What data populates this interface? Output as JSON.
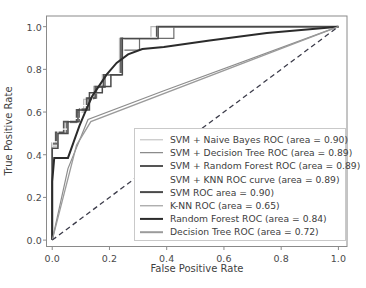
{
  "chart_data": {
    "type": "line",
    "title": "",
    "xlabel": "False Positive Rate",
    "ylabel": "True Positive Rate",
    "xlim": [
      -0.02,
      1.03
    ],
    "ylim": [
      -0.03,
      1.05
    ],
    "xticks": [
      "0.0",
      "0.2",
      "0.4",
      "0.6",
      "0.8",
      "1.0"
    ],
    "xtick_values": [
      0.0,
      0.2,
      0.4,
      0.6,
      0.8,
      1.0
    ],
    "yticks": [
      "0.0",
      "0.2",
      "0.4",
      "0.6",
      "0.8",
      "1.0"
    ],
    "ytick_values": [
      0.0,
      0.2,
      0.4,
      0.6,
      0.8,
      1.0
    ],
    "grid": false,
    "legend_position": "center-right",
    "series": [
      {
        "name": "SVM + Naive Bayes ROC (area = 0.90)",
        "area": 0.9,
        "color": "#b9b9b9",
        "width": 1.2,
        "dash": "none",
        "points": [
          [
            0.0,
            0.0
          ],
          [
            0.0,
            0.44
          ],
          [
            0.02,
            0.44
          ],
          [
            0.02,
            0.5
          ],
          [
            0.045,
            0.5
          ],
          [
            0.045,
            0.55
          ],
          [
            0.085,
            0.55
          ],
          [
            0.085,
            0.6
          ],
          [
            0.11,
            0.6
          ],
          [
            0.11,
            0.66
          ],
          [
            0.145,
            0.66
          ],
          [
            0.145,
            0.72
          ],
          [
            0.175,
            0.72
          ],
          [
            0.175,
            0.775
          ],
          [
            0.235,
            0.775
          ],
          [
            0.235,
            0.945
          ],
          [
            0.345,
            0.945
          ],
          [
            0.345,
            1.0
          ],
          [
            1.0,
            1.0
          ]
        ]
      },
      {
        "name": "SVM + Decision Tree ROC (area = 0.89)",
        "area": 0.89,
        "color": "#6e6e6e",
        "width": 1.2,
        "dash": "none",
        "points": [
          [
            0.0,
            0.0
          ],
          [
            0.0,
            0.45
          ],
          [
            0.015,
            0.45
          ],
          [
            0.015,
            0.5
          ],
          [
            0.05,
            0.5
          ],
          [
            0.05,
            0.555
          ],
          [
            0.095,
            0.555
          ],
          [
            0.095,
            0.615
          ],
          [
            0.125,
            0.615
          ],
          [
            0.125,
            0.665
          ],
          [
            0.155,
            0.665
          ],
          [
            0.155,
            0.715
          ],
          [
            0.185,
            0.715
          ],
          [
            0.185,
            0.775
          ],
          [
            0.245,
            0.775
          ],
          [
            0.245,
            0.89
          ],
          [
            0.305,
            0.89
          ],
          [
            0.305,
            0.945
          ],
          [
            0.425,
            0.945
          ],
          [
            0.425,
            1.0
          ],
          [
            1.0,
            1.0
          ]
        ]
      },
      {
        "name": "SVM + Random Forest ROC (area = 0.89)",
        "area": 0.89,
        "color": "#555555",
        "width": 1.6,
        "dash": "none",
        "points": [
          [
            0.0,
            0.0
          ],
          [
            0.0,
            0.455
          ],
          [
            0.012,
            0.455
          ],
          [
            0.012,
            0.505
          ],
          [
            0.04,
            0.505
          ],
          [
            0.04,
            0.555
          ],
          [
            0.085,
            0.555
          ],
          [
            0.085,
            0.61
          ],
          [
            0.12,
            0.61
          ],
          [
            0.12,
            0.665
          ],
          [
            0.15,
            0.665
          ],
          [
            0.15,
            0.72
          ],
          [
            0.18,
            0.72
          ],
          [
            0.18,
            0.775
          ],
          [
            0.24,
            0.775
          ],
          [
            0.24,
            0.945
          ],
          [
            0.365,
            0.945
          ],
          [
            0.365,
            1.0
          ],
          [
            1.0,
            1.0
          ]
        ]
      },
      {
        "name": "SVM + KNN ROC curve (area = 0.89)",
        "area": 0.89,
        "color": "#ffffff",
        "width": 1.2,
        "dash": "none",
        "points": [
          [
            0.0,
            0.0
          ],
          [
            0.0,
            0.46
          ],
          [
            0.02,
            0.46
          ],
          [
            0.02,
            0.52
          ],
          [
            0.06,
            0.52
          ],
          [
            0.06,
            0.57
          ],
          [
            0.1,
            0.57
          ],
          [
            0.1,
            0.63
          ],
          [
            0.14,
            0.63
          ],
          [
            0.14,
            0.69
          ],
          [
            0.19,
            0.69
          ],
          [
            0.19,
            0.78
          ],
          [
            0.25,
            0.78
          ],
          [
            0.25,
            0.95
          ],
          [
            0.37,
            0.95
          ],
          [
            0.37,
            1.0
          ],
          [
            1.0,
            1.0
          ]
        ]
      },
      {
        "name": "SVM ROC area = 0.90)",
        "area": 0.9,
        "color": "#4a4a4a",
        "width": 1.5,
        "dash": "none",
        "points": [
          [
            0.0,
            0.0
          ],
          [
            0.0,
            0.43
          ],
          [
            0.02,
            0.43
          ],
          [
            0.02,
            0.5
          ],
          [
            0.055,
            0.5
          ],
          [
            0.055,
            0.555
          ],
          [
            0.09,
            0.555
          ],
          [
            0.09,
            0.61
          ],
          [
            0.13,
            0.61
          ],
          [
            0.13,
            0.69
          ],
          [
            0.175,
            0.69
          ],
          [
            0.175,
            0.72
          ],
          [
            0.205,
            0.72
          ],
          [
            0.205,
            0.775
          ],
          [
            0.245,
            0.775
          ],
          [
            0.245,
            0.945
          ],
          [
            0.37,
            0.945
          ],
          [
            0.37,
            1.0
          ],
          [
            1.0,
            1.0
          ]
        ]
      },
      {
        "name": "K-NN ROC (area = 0.65)",
        "area": 0.65,
        "color": "#8d8d8d",
        "width": 1.2,
        "dash": "none",
        "points": [
          [
            0.0,
            0.0
          ],
          [
            0.055,
            0.335
          ],
          [
            0.125,
            0.565
          ],
          [
            0.39,
            0.7
          ],
          [
            1.0,
            1.0
          ]
        ]
      },
      {
        "name": "Random Forest ROC  (area = 0.84)",
        "area": 0.84,
        "color": "#2b2b2b",
        "width": 2.0,
        "dash": "none",
        "points": [
          [
            0.0,
            0.0
          ],
          [
            0.0,
            0.275
          ],
          [
            0.007,
            0.385
          ],
          [
            0.055,
            0.385
          ],
          [
            0.075,
            0.46
          ],
          [
            0.095,
            0.535
          ],
          [
            0.115,
            0.6
          ],
          [
            0.14,
            0.675
          ],
          [
            0.165,
            0.725
          ],
          [
            0.19,
            0.775
          ],
          [
            0.225,
            0.83
          ],
          [
            0.265,
            0.87
          ],
          [
            0.315,
            0.895
          ],
          [
            0.39,
            0.905
          ],
          [
            0.55,
            0.935
          ],
          [
            0.75,
            0.97
          ],
          [
            1.0,
            1.0
          ]
        ]
      },
      {
        "name": "Decision Tree ROC (area = 0.72)",
        "area": 0.72,
        "color": "#9b9b9b",
        "width": 1.3,
        "dash": "none",
        "points": [
          [
            0.0,
            0.0
          ],
          [
            0.085,
            0.445
          ],
          [
            0.135,
            0.555
          ],
          [
            1.0,
            1.0
          ]
        ]
      },
      {
        "name": "chance-reference-line",
        "area": 0.5,
        "color": "#3c3c4a",
        "width": 1.3,
        "dash": "5,3.5",
        "reference": true,
        "points": [
          [
            0.0,
            0.0
          ],
          [
            1.0,
            1.0
          ]
        ]
      }
    ],
    "legend_entries": [
      {
        "label": "SVM + Naive Bayes ROC (area = 0.90)",
        "color": "#b9b9b9",
        "width": 1.4
      },
      {
        "label": "SVM + Decision Tree ROC (area = 0.89)",
        "color": "#6e6e6e",
        "width": 1.6
      },
      {
        "label": "SVM + Random Forest ROC (area = 0.89)",
        "color": "#555555",
        "width": 2.0
      },
      {
        "label": "SVM + KNN ROC curve (area = 0.89)",
        "color": "#ffffff",
        "width": 1.4
      },
      {
        "label": "SVM ROC area = 0.90)",
        "color": "#4a4a4a",
        "width": 1.8
      },
      {
        "label": "K-NN ROC (area = 0.65)",
        "color": "#8d8d8d",
        "width": 1.4
      },
      {
        "label": "Random Forest ROC  (area = 0.84)",
        "color": "#2b2b2b",
        "width": 2.2
      },
      {
        "label": "Decision Tree ROC (area = 0.72)",
        "color": "#9b9b9b",
        "width": 1.6
      }
    ],
    "axis_color": "#8a8a8a",
    "background": "#ffffff"
  }
}
